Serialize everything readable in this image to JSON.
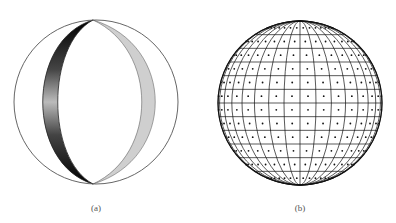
{
  "panels": [
    {
      "id": "a",
      "label": "(a)",
      "center": [
        96,
        102
      ],
      "radius": 82,
      "label_pos": [
        96,
        205
      ],
      "description": "Sphere outline with two shaded lunes (meridian bands); left band dark gradient, right band light gray"
    },
    {
      "id": "b",
      "label": "(b)",
      "center": [
        300,
        103
      ],
      "radius": 82,
      "label_pos": [
        300,
        205
      ],
      "latitude_rows": 12,
      "longitude_cols": 16,
      "description": "Sphere divided into latitude-longitude grid with a dot at each cell center"
    }
  ],
  "colors": {
    "outline": "#555555",
    "grid": "#111111",
    "dark_band": "#1a1a1a",
    "light_band": "#cfcfcf"
  }
}
